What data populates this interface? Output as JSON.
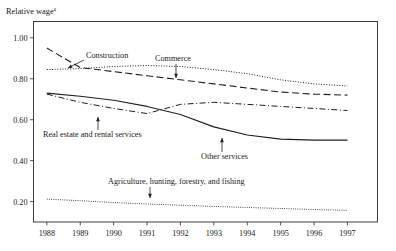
{
  "figure": {
    "y_axis_title": "Relative wage",
    "y_axis_title_superscript": "a"
  },
  "chart_data": {
    "type": "line",
    "title": "Relative wage",
    "xlabel": "",
    "ylabel": "Relative wage",
    "xlim": [
      1987.6,
      1997.9
    ],
    "ylim": [
      0.1,
      1.08
    ],
    "grid": false,
    "legend": "inline-annotations",
    "x": [
      1988,
      1989,
      1990,
      1991,
      1992,
      1993,
      1994,
      1995,
      1996,
      1997
    ],
    "xtick_labels": [
      "1988",
      "1989",
      "1990",
      "1991",
      "1992",
      "1993",
      "1994",
      "1995",
      "1996",
      "1997"
    ],
    "ytick_labels": [
      "0.20",
      "0.40",
      "0.60",
      "0.80",
      "1.00"
    ],
    "ytick_values": [
      0.2,
      0.4,
      0.6,
      0.8,
      1.0
    ],
    "series": [
      {
        "name": "Construction",
        "style": "dashed",
        "dash": "7,3.5",
        "width": 1.1,
        "values": [
          0.95,
          0.855,
          0.835,
          0.815,
          0.795,
          0.775,
          0.755,
          0.735,
          0.725,
          0.72
        ]
      },
      {
        "name": "Commerce",
        "style": "dotted",
        "dash": "1,1.6",
        "width": 1.0,
        "values": [
          0.845,
          0.85,
          0.86,
          0.865,
          0.86,
          0.845,
          0.825,
          0.795,
          0.775,
          0.765
        ]
      },
      {
        "name": "Real estate and rental services",
        "style": "dash-dot",
        "dash": "6,2.5,1,2.5",
        "width": 1.0,
        "values": [
          0.725,
          0.685,
          0.655,
          0.63,
          0.675,
          0.685,
          0.675,
          0.665,
          0.655,
          0.645
        ]
      },
      {
        "name": "Other services",
        "style": "solid",
        "dash": "none",
        "width": 1.1,
        "values": [
          0.73,
          0.715,
          0.695,
          0.665,
          0.625,
          0.565,
          0.525,
          0.505,
          0.5,
          0.5
        ]
      },
      {
        "name": "Agriculture, hunting, forestry, and fishing",
        "style": "dotted-fine",
        "dash": "0.8,1.4",
        "width": 1.0,
        "values": [
          0.212,
          0.204,
          0.195,
          0.188,
          0.182,
          0.176,
          0.171,
          0.166,
          0.161,
          0.157
        ]
      }
    ],
    "annotations": [
      {
        "name": "construction",
        "text": "Construction",
        "text_x": 86,
        "text_y": 58,
        "leader_from_x": 84,
        "leader_from_y": 60,
        "leader_to_x": 68,
        "leader_to_y": 68,
        "anchor": "start"
      },
      {
        "name": "commerce",
        "text": "Commerce",
        "text_x": 155,
        "text_y": 61,
        "leader_from_x": 176,
        "leader_from_y": 64,
        "leader_to_x": 176,
        "leader_to_y": 78,
        "anchor": "start"
      },
      {
        "name": "real-estate-and-rental-services",
        "text": "Real estate and rental services",
        "text_x": 43,
        "text_y": 137,
        "leader_from_x": 98,
        "leader_from_y": 130,
        "leader_to_x": 98,
        "leader_to_y": 117,
        "anchor": "start"
      },
      {
        "name": "other-services",
        "text": "Other services",
        "text_x": 201,
        "text_y": 159,
        "leader_from_x": 222,
        "leader_from_y": 152,
        "leader_to_x": 222,
        "leader_to_y": 138,
        "anchor": "start"
      },
      {
        "name": "agriculture-hunting-forestry-and-fishing",
        "text": "Agriculture, hunting, forestry, and fishing",
        "text_x": 108,
        "text_y": 184,
        "leader_from_x": 150,
        "leader_from_y": 187,
        "leader_to_x": 150,
        "leader_to_y": 198,
        "anchor": "start"
      }
    ]
  }
}
